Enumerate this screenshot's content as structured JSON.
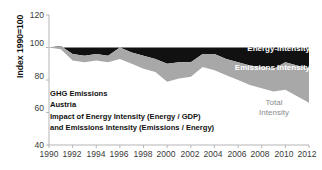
{
  "chart_data": {
    "type": "area",
    "stacked_bands": true,
    "title": "",
    "xlabel": "",
    "ylabel": "Index 1990=100",
    "xlim": [
      1990,
      2012
    ],
    "ylim": [
      40,
      120
    ],
    "y_ticks": [
      40,
      60,
      80,
      100,
      120
    ],
    "x_ticks": [
      1990,
      1992,
      1994,
      1996,
      1998,
      2000,
      2002,
      2004,
      2006,
      2008,
      2010,
      2012
    ],
    "grid": false,
    "legend_position": "inline-on-bands",
    "x": [
      1990,
      1991,
      1992,
      1993,
      1994,
      1995,
      1996,
      1997,
      1998,
      1999,
      2000,
      2001,
      2002,
      2003,
      2004,
      2005,
      2006,
      2007,
      2008,
      2009,
      2010,
      2011,
      2012
    ],
    "series": [
      {
        "name": "Energy-Intensity",
        "color": "#111111",
        "description": "Upper boundary of black band (constant reference at index 100)",
        "values": [
          100,
          100,
          100,
          100,
          100,
          100,
          100,
          100,
          100,
          100,
          100,
          100,
          100,
          100,
          100,
          100,
          100,
          100,
          100,
          100,
          100,
          100,
          100
        ]
      },
      {
        "name": "Emissions Intensity",
        "color": "#a8a8a8",
        "description": "Boundary between black and gray bands (top of gray area)",
        "values": [
          100,
          101,
          96,
          95,
          96,
          95,
          100,
          97,
          95,
          93,
          90,
          91,
          91,
          96,
          96,
          93,
          91,
          89,
          88,
          87,
          91,
          89,
          87
        ]
      },
      {
        "name": "Total Intensity",
        "color": "#ffffff",
        "description": "Lower boundary of gray band (total intensity index)",
        "values": [
          100,
          99,
          92,
          91,
          92,
          91,
          93,
          90,
          87,
          85,
          79,
          81,
          82,
          88,
          86,
          83,
          80,
          77,
          75,
          73,
          74,
          70,
          66
        ]
      }
    ],
    "annotations": [
      "GHG Emissions",
      "Austria",
      "Impact of Energy Intensity (Energy / GDP)",
      "and Emissions Intensity (Emissions / Energy)"
    ],
    "inline_labels": [
      {
        "text": "Energy-Intensity",
        "color": "#ffffff"
      },
      {
        "text": "Emissions Intensity",
        "color": "#ffffff"
      },
      {
        "text": "Total",
        "text2": "Intensity",
        "color": "#8c8c8c"
      }
    ]
  },
  "axis": {
    "y_title": "Index 1990=100",
    "y_labels": [
      "120",
      "100",
      "80",
      "60",
      "40"
    ],
    "x_labels": [
      "1990",
      "1992",
      "1994",
      "1996",
      "1998",
      "2000",
      "2002",
      "2004",
      "2006",
      "2008",
      "2010",
      "2012"
    ]
  },
  "annotation": {
    "line1": "GHG Emissions",
    "line2": "Austria",
    "line3": "Impact of Energy Intensity (Energy / GDP)",
    "line4": "and Emissions Intensity (Emissions / Energy)"
  },
  "labels": {
    "energy_intensity": "Energy-Intensity",
    "emissions_intensity": "Emissions Intensity",
    "total_intensity_line1": "Total",
    "total_intensity_line2": "Intensity"
  },
  "colors": {
    "band_energy": "#111111",
    "band_emissions": "#a8a8a8",
    "background": "#ffffff",
    "axis": "#b0b0b0",
    "text": "#3a3a3a"
  }
}
